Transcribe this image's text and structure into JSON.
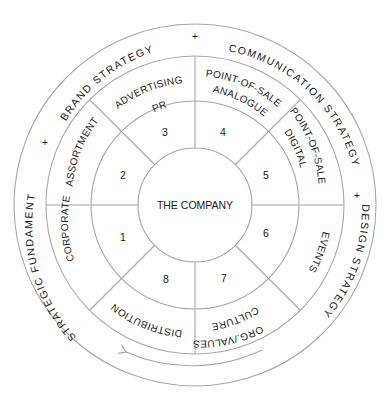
{
  "diagram": {
    "center_label": "THE COMPANY",
    "outer_ring": [
      {
        "label": "BRAND STRATEGY"
      },
      {
        "label": "COMMUNICATION STRATEGY"
      },
      {
        "label": "DESIGN STRATEGY"
      },
      {
        "label": "STRATEGIC FUNDAMENT"
      }
    ],
    "separator_symbol": "+",
    "segments": [
      {
        "number": "1",
        "label_lines": [
          "CORPORATE"
        ]
      },
      {
        "number": "2",
        "label_lines": [
          "ASSORTMENT"
        ]
      },
      {
        "number": "3",
        "label_lines": [
          "ADVERTISING",
          "PR"
        ]
      },
      {
        "number": "4",
        "label_lines": [
          "POINT-OF-SALE",
          "ANALOGUE"
        ]
      },
      {
        "number": "5",
        "label_lines": [
          "POINT-OF-SALE",
          "DIGITAL"
        ]
      },
      {
        "number": "6",
        "label_lines": [
          "EVENTS"
        ]
      },
      {
        "number": "7",
        "label_lines": [
          "ORG./VALUES",
          "CULTURE"
        ]
      },
      {
        "number": "8",
        "label_lines": [
          "DISTRIBUTION"
        ]
      }
    ],
    "arrow_direction": "counter-clockwise"
  }
}
